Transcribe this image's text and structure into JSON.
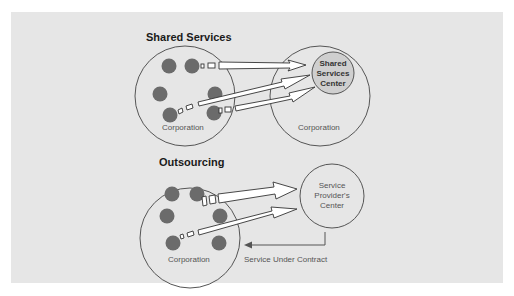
{
  "shared_services": {
    "title": "Shared Services",
    "left_circle_label": "Corporation",
    "center_label_line1": "Shared",
    "center_label_line2": "Services",
    "center_label_line3": "Center",
    "right_circle_label": "Corporation"
  },
  "outsourcing": {
    "title": "Outsourcing",
    "left_circle_label": "Corporation",
    "provider_label_line1": "Service",
    "provider_label_line2": "Provider's",
    "provider_label_line3": "Center",
    "return_label": "Service Under Contract"
  },
  "colors": {
    "panel_background": "#e6e6e6",
    "dot_fill": "#6b6b6b",
    "outline": "#555555",
    "center_fill": "#cfcfcf"
  }
}
